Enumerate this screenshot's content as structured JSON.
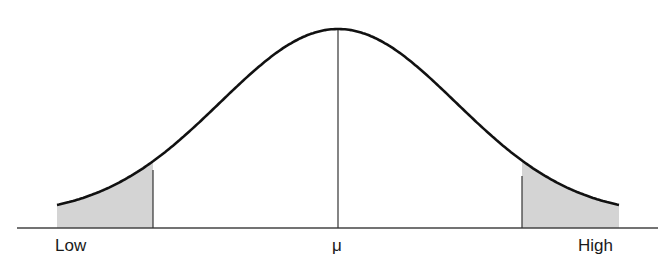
{
  "diagram": {
    "type": "normal-distribution-curve",
    "labels": {
      "left": "Low",
      "center": "μ",
      "right": "High"
    },
    "colors": {
      "curve": "#111111",
      "axis": "#444444",
      "shade": "#d4d4d4",
      "divider": "#333333"
    },
    "shaded_regions": [
      "left-tail",
      "right-tail"
    ]
  },
  "chart_data": {
    "type": "area",
    "title": "",
    "xlabel": "",
    "ylabel": "",
    "tick_labels": [
      "Low",
      "μ",
      "High"
    ],
    "curve": "normal distribution (bell curve) centered at μ",
    "shaded": [
      {
        "region": "left tail",
        "from": "Low",
        "to": "approx μ - 1.5σ"
      },
      {
        "region": "right tail",
        "from": "approx μ + 1.5σ",
        "to": "High"
      }
    ],
    "vertical_lines": [
      "left shade boundary",
      "μ (mean)",
      "right shade boundary"
    ],
    "grid": false,
    "legend": null
  }
}
